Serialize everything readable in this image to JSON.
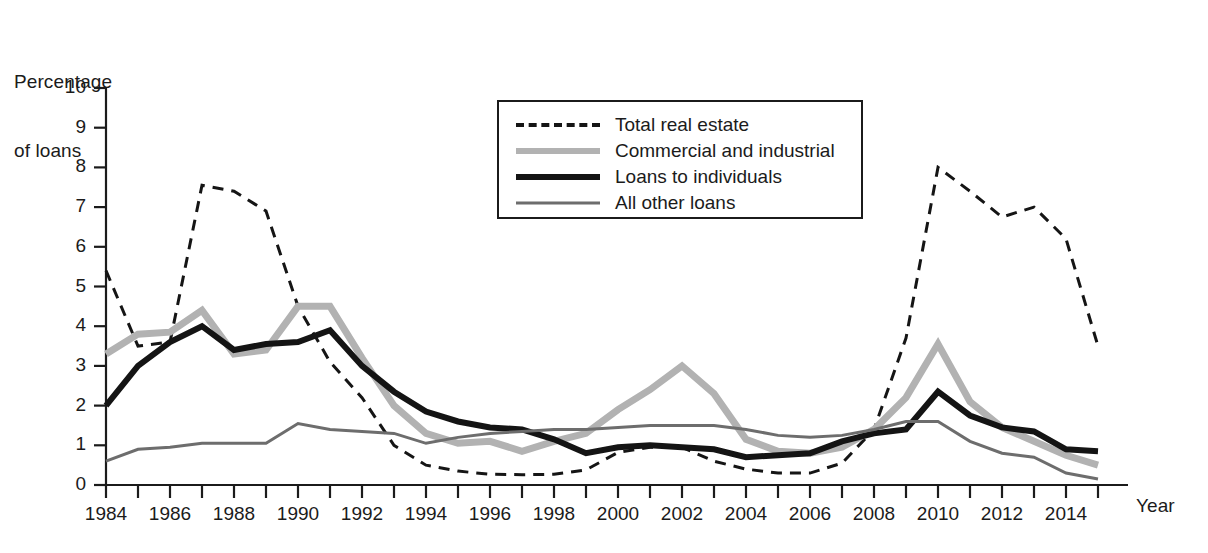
{
  "axes": {
    "ylabel_line1": "Percentage",
    "ylabel_line2": "of loans",
    "xlabel": "Year",
    "yticks": [
      "0",
      "1",
      "2",
      "3",
      "4",
      "5",
      "6",
      "7",
      "8",
      "9",
      "10"
    ],
    "xticks": [
      "1984",
      "1986",
      "1988",
      "1990",
      "1992",
      "1994",
      "1996",
      "1998",
      "2000",
      "2002",
      "2004",
      "2006",
      "2008",
      "2010",
      "2012",
      "2014"
    ]
  },
  "legend": {
    "items": [
      {
        "label": "Total real estate",
        "style": "sw-dashed",
        "icon": "dashed-line-icon",
        "color": "#151515"
      },
      {
        "label": "Commercial and industrial",
        "style": "sw-thickgray",
        "icon": "thick-gray-line-icon",
        "color": "#b2b2b2"
      },
      {
        "label": "Loans to individuals",
        "style": "sw-thickblack",
        "icon": "thick-black-line-icon",
        "color": "#141414"
      },
      {
        "label": "All other loans",
        "style": "sw-thingray",
        "icon": "thin-gray-line-icon",
        "color": "#6d6d6d"
      }
    ]
  },
  "chart_data": {
    "type": "line",
    "title": "",
    "xlabel": "Year",
    "ylabel": "Percentage of loans",
    "xlim": [
      1984,
      2015
    ],
    "ylim": [
      0,
      10
    ],
    "grid": false,
    "legend_position": "upper-center",
    "x": [
      1984,
      1985,
      1986,
      1987,
      1988,
      1989,
      1990,
      1991,
      1992,
      1993,
      1994,
      1995,
      1996,
      1997,
      1998,
      1999,
      2000,
      2001,
      2002,
      2003,
      2004,
      2005,
      2006,
      2007,
      2008,
      2009,
      2010,
      2011,
      2012,
      2013,
      2014,
      2015
    ],
    "series": [
      {
        "name": "Total real estate",
        "color": "#151515",
        "dash": "dashed",
        "width": 3,
        "values": [
          5.4,
          3.5,
          3.6,
          7.55,
          7.4,
          6.9,
          4.5,
          3.1,
          2.2,
          1.0,
          0.5,
          0.35,
          0.27,
          0.26,
          0.27,
          0.38,
          0.82,
          0.95,
          0.95,
          0.6,
          0.4,
          0.3,
          0.3,
          0.55,
          1.4,
          3.7,
          8.0,
          7.4,
          6.75,
          7.0,
          6.2,
          3.5
        ]
      },
      {
        "name": "Commercial and industrial",
        "color": "#b2b2b2",
        "dash": "solid",
        "width": 7,
        "values": [
          3.3,
          3.8,
          3.85,
          4.4,
          3.3,
          3.4,
          4.5,
          4.5,
          3.2,
          2.0,
          1.3,
          1.05,
          1.1,
          0.85,
          1.1,
          1.3,
          1.9,
          2.4,
          3.0,
          2.3,
          1.15,
          0.85,
          0.8,
          0.95,
          1.4,
          2.2,
          3.55,
          2.1,
          1.45,
          1.1,
          0.75,
          0.5
        ]
      },
      {
        "name": "Loans to individuals",
        "color": "#141414",
        "dash": "solid",
        "width": 6,
        "values": [
          2.0,
          3.0,
          3.6,
          4.0,
          3.4,
          3.55,
          3.6,
          3.9,
          3.0,
          2.35,
          1.85,
          1.6,
          1.45,
          1.4,
          1.15,
          0.8,
          0.95,
          1.0,
          0.95,
          0.9,
          0.7,
          0.75,
          0.8,
          1.1,
          1.3,
          1.4,
          2.35,
          1.75,
          1.45,
          1.35,
          0.9,
          0.85
        ]
      },
      {
        "name": "All other loans",
        "color": "#6d6d6d",
        "dash": "solid",
        "width": 3,
        "values": [
          0.6,
          0.9,
          0.95,
          1.05,
          1.05,
          1.05,
          1.55,
          1.4,
          1.35,
          1.3,
          1.05,
          1.2,
          1.3,
          1.35,
          1.4,
          1.4,
          1.45,
          1.5,
          1.5,
          1.5,
          1.4,
          1.25,
          1.2,
          1.25,
          1.4,
          1.6,
          1.6,
          1.1,
          0.8,
          0.7,
          0.3,
          0.15
        ]
      }
    ]
  }
}
